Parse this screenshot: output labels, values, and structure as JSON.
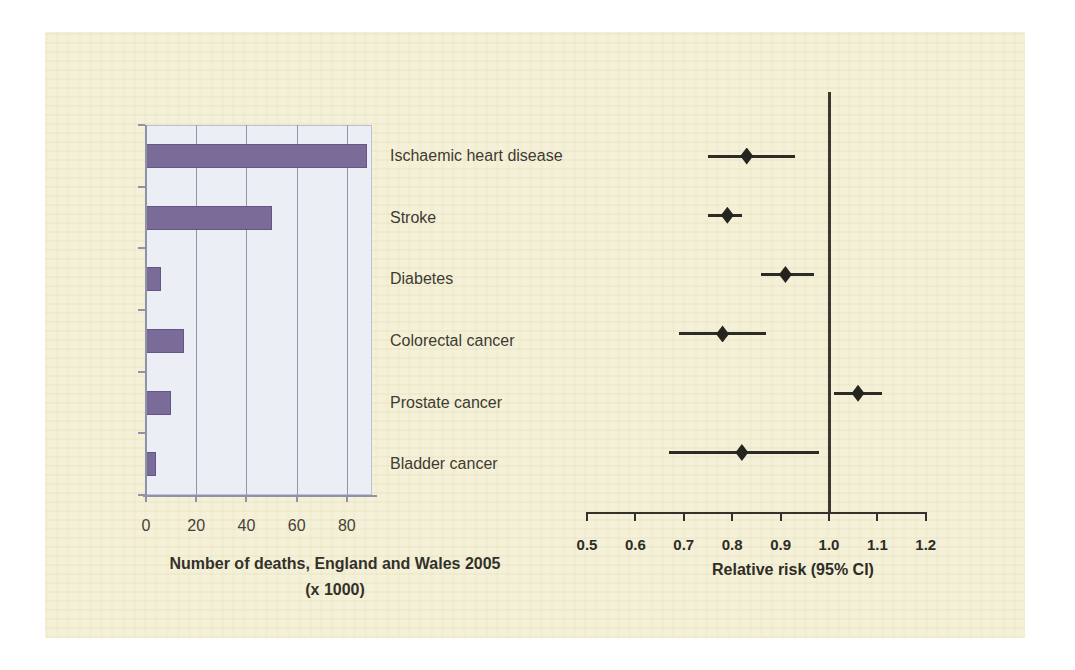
{
  "page": {
    "background_color": "#ffffff",
    "paper_color": "#f5f1d8",
    "description_colors": {
      "bar_fill": "#7b6b99",
      "bar_plot_background": "#eceef6",
      "gridline": "#9098ae",
      "forest_ink": "#2d2b25",
      "text": "#3e3b33"
    }
  },
  "categories": [
    "Ischaemic heart disease",
    "Stroke",
    "Diabetes",
    "Colorectal cancer",
    "Prostate cancer",
    "Bladder cancer"
  ],
  "chart_data": [
    {
      "type": "bar",
      "orientation": "horizontal",
      "title_lines": [
        "Number of deaths, England and Wales 2005",
        "(x 1000)"
      ],
      "title": "Number of deaths, England and Wales 2005 (x 1000)",
      "categories": [
        "Ischaemic heart disease",
        "Stroke",
        "Diabetes",
        "Colorectal cancer",
        "Prostate cancer",
        "Bladder cancer"
      ],
      "values": [
        88,
        50,
        6,
        15,
        10,
        4
      ],
      "xlabel": "Number of deaths, England and Wales 2005 (x 1000)",
      "ylabel": "",
      "xlim": [
        0,
        90
      ],
      "x_ticks": [
        0,
        20,
        40,
        60,
        80
      ],
      "grid": true,
      "legend": "none",
      "bar_color": "#7b6b99",
      "plot_background": "#eceef6"
    },
    {
      "type": "scatter",
      "subtype": "forest-plot",
      "title": "",
      "xlabel": "Relative risk (95% CI)",
      "ylabel": "",
      "xlim": [
        0.5,
        1.2
      ],
      "x_ticks": [
        0.5,
        0.6,
        0.7,
        0.8,
        0.9,
        1.0,
        1.1,
        1.2
      ],
      "reference_line": 1.0,
      "grid": false,
      "legend": "none",
      "marker": "diamond",
      "series": [
        {
          "name": "Relative risk (95% CI)",
          "points": [
            {
              "category": "Ischaemic heart disease",
              "rr": 0.83,
              "ci_low": 0.75,
              "ci_high": 0.93
            },
            {
              "category": "Stroke",
              "rr": 0.79,
              "ci_low": 0.75,
              "ci_high": 0.82
            },
            {
              "category": "Diabetes",
              "rr": 0.91,
              "ci_low": 0.86,
              "ci_high": 0.97
            },
            {
              "category": "Colorectal cancer",
              "rr": 0.78,
              "ci_low": 0.69,
              "ci_high": 0.87
            },
            {
              "category": "Prostate cancer",
              "rr": 1.06,
              "ci_low": 1.01,
              "ci_high": 1.11
            },
            {
              "category": "Bladder cancer",
              "rr": 0.82,
              "ci_low": 0.67,
              "ci_high": 0.98
            }
          ]
        }
      ]
    }
  ]
}
